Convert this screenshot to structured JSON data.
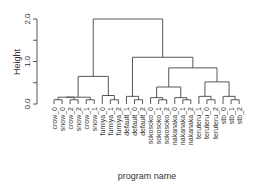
{
  "chart_data": {
    "type": "dendrogram",
    "title": "",
    "xlabel": "program name",
    "ylabel": "Height",
    "ylim": [
      0,
      2.0
    ],
    "yticks": [
      0.0,
      0.5,
      1.0,
      1.5,
      2.0
    ],
    "ytick_labels": [
      "0.0",
      "",
      "1.0",
      "",
      "2.0"
    ],
    "grid": false,
    "leaves": [
      "crow_0",
      "snow_0",
      "crow_2",
      "snow_2",
      "crow_1",
      "snow_1",
      "fumiya_0",
      "fumiya_1",
      "fumiya_2",
      "default_1",
      "default_0",
      "default_2",
      "sokosoko_0",
      "sokosoko_1",
      "sokosoko_2",
      "nakanaka_0",
      "nakanaka_1",
      "nakanaka_2",
      "teruteru_1",
      "teruteru_0",
      "teruteru_2",
      "stb_0",
      "stb_1",
      "stb_2"
    ],
    "merges": [
      {
        "left": [
          0
        ],
        "right": [
          1
        ],
        "height": 0.1
      },
      {
        "left": [
          2
        ],
        "right": [
          3
        ],
        "height": 0.1
      },
      {
        "left": [
          4
        ],
        "right": [
          5
        ],
        "height": 0.1
      },
      {
        "left": [
          0,
          1
        ],
        "right": [
          2,
          3
        ],
        "height": 0.16
      },
      {
        "left": [
          0,
          1,
          2,
          3
        ],
        "right": [
          4,
          5
        ],
        "height": 0.16
      },
      {
        "left": [
          7
        ],
        "right": [
          8
        ],
        "height": 0.1
      },
      {
        "left": [
          6
        ],
        "right": [
          7,
          8
        ],
        "height": 0.2
      },
      {
        "left": [
          0,
          1,
          2,
          3,
          4,
          5
        ],
        "right": [
          6,
          7,
          8
        ],
        "height": 0.65
      },
      {
        "left": [
          10
        ],
        "right": [
          11
        ],
        "height": 0.1
      },
      {
        "left": [
          9
        ],
        "right": [
          10,
          11
        ],
        "height": 0.18
      },
      {
        "left": [
          13
        ],
        "right": [
          14
        ],
        "height": 0.1
      },
      {
        "left": [
          12
        ],
        "right": [
          13,
          14
        ],
        "height": 0.15
      },
      {
        "left": [
          16
        ],
        "right": [
          17
        ],
        "height": 0.1
      },
      {
        "left": [
          15
        ],
        "right": [
          16,
          17
        ],
        "height": 0.15
      },
      {
        "left": [
          12,
          13,
          14
        ],
        "right": [
          15,
          16,
          17
        ],
        "height": 0.4
      },
      {
        "left": [
          19
        ],
        "right": [
          20
        ],
        "height": 0.1
      },
      {
        "left": [
          18
        ],
        "right": [
          19,
          20
        ],
        "height": 0.18
      },
      {
        "left": [
          22
        ],
        "right": [
          23
        ],
        "height": 0.1
      },
      {
        "left": [
          21
        ],
        "right": [
          22,
          23
        ],
        "height": 0.18
      },
      {
        "left": [
          18,
          19,
          20
        ],
        "right": [
          21,
          22,
          23
        ],
        "height": 0.52
      },
      {
        "left": [
          12,
          13,
          14,
          15,
          16,
          17
        ],
        "right": [
          18,
          19,
          20,
          21,
          22,
          23
        ],
        "height": 0.85
      },
      {
        "left": [
          9,
          10,
          11
        ],
        "right": [
          12,
          13,
          14,
          15,
          16,
          17,
          18,
          19,
          20,
          21,
          22,
          23
        ],
        "height": 1.1
      },
      {
        "left": [
          0,
          1,
          2,
          3,
          4,
          5,
          6,
          7,
          8
        ],
        "right": [
          9,
          10,
          11,
          12,
          13,
          14,
          15,
          16,
          17,
          18,
          19,
          20,
          21,
          22,
          23
        ],
        "height": 2.0
      }
    ]
  },
  "colors": {
    "line": "#444444",
    "text": "#333333",
    "background": "#ffffff"
  }
}
